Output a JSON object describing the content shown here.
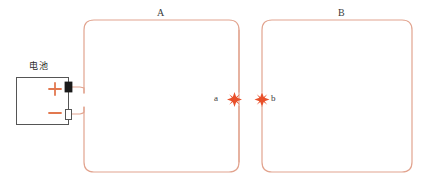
{
  "diagram": {
    "colors": {
      "wire": "#e2a48f",
      "node": "#e8502a",
      "battery_outline": "#555555",
      "battery_terminal_positive": "#1a1a1a",
      "battery_terminal_negative": "#ffffff",
      "polarity_mark": "#e2784f",
      "text": "#3a3a3a",
      "background": "#ffffff"
    },
    "loops": [
      {
        "id": "A",
        "label": "A"
      },
      {
        "id": "B",
        "label": "B"
      }
    ],
    "nodes": [
      {
        "id": "a",
        "label": "a",
        "icon": "star-node-icon"
      },
      {
        "id": "b",
        "label": "b",
        "icon": "star-node-icon"
      }
    ],
    "battery": {
      "label": "电池",
      "positive_symbol": "+",
      "negative_symbol": "−"
    }
  }
}
